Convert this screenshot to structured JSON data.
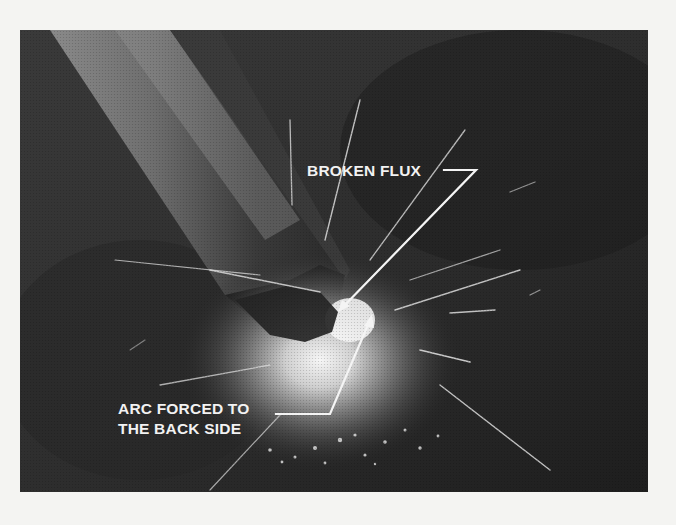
{
  "figure": {
    "style": "black-and-white halftone photograph",
    "callouts": [
      {
        "id": "broken-flux",
        "lines": [
          "BROKEN FLUX"
        ]
      },
      {
        "id": "arc-forced",
        "lines": [
          "ARC FORCED TO",
          "THE BACK SIDE"
        ]
      }
    ],
    "colors": {
      "background_page": "#f4f4f2",
      "photo_dark": "#2a2a2a",
      "label_text": "#f2f2f2",
      "leader_line": "#f4f4f4"
    }
  }
}
